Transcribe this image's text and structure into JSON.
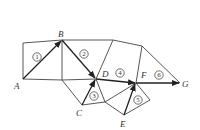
{
  "diagram": {
    "type": "network-path",
    "nodes": [
      {
        "id": "A",
        "label": "A",
        "x": 23,
        "y": 79,
        "lx": 14,
        "ly": 89
      },
      {
        "id": "B",
        "label": "B",
        "x": 62,
        "y": 40,
        "lx": 58,
        "ly": 37
      },
      {
        "id": "C",
        "label": "C",
        "x": 82,
        "y": 105,
        "lx": 76,
        "ly": 116
      },
      {
        "id": "D",
        "label": "D",
        "x": 96,
        "y": 79,
        "lx": 102,
        "ly": 77
      },
      {
        "id": "E",
        "label": "E",
        "x": 124,
        "y": 115,
        "lx": 120,
        "ly": 127
      },
      {
        "id": "F",
        "label": "F",
        "x": 136,
        "y": 83,
        "lx": 141,
        "ly": 78
      },
      {
        "id": "G",
        "label": "G",
        "x": 180,
        "y": 83,
        "lx": 182,
        "ly": 87
      }
    ],
    "path_steps": [
      {
        "num": "1",
        "from": "A",
        "to": "B",
        "cx": 37,
        "cy": 57
      },
      {
        "num": "2",
        "from": "B",
        "to": "D",
        "cx": 84,
        "cy": 54
      },
      {
        "num": "3",
        "from": "C",
        "to": "D",
        "cx": 94,
        "cy": 96
      },
      {
        "num": "4",
        "from": "D",
        "to": "F",
        "cx": 120,
        "cy": 73
      },
      {
        "num": "5",
        "from": "E",
        "to": "F",
        "cx": 138,
        "cy": 100
      },
      {
        "num": "6",
        "from": "F",
        "to": "G",
        "cx": 159,
        "cy": 75
      }
    ]
  }
}
